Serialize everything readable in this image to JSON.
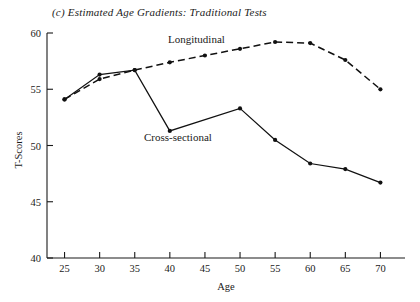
{
  "chart_data": {
    "type": "line",
    "title": "(c) Estimated Age Gradients: Traditional Tests",
    "xlabel": "Age",
    "ylabel": "T-Scores",
    "x": [
      25,
      30,
      35,
      40,
      45,
      50,
      55,
      60,
      65,
      70
    ],
    "xlim": [
      22.5,
      73.5
    ],
    "ylim": [
      40,
      60
    ],
    "xticks": [
      25,
      30,
      35,
      40,
      45,
      50,
      55,
      60,
      65,
      70
    ],
    "yticks": [
      40,
      45,
      50,
      55,
      60
    ],
    "xtick_labels": [
      "25",
      "30",
      "35",
      "40",
      "45",
      "50",
      "55",
      "60",
      "65",
      "70"
    ],
    "ytick_labels": [
      "40",
      "45",
      "50",
      "55",
      "60"
    ],
    "grid": false,
    "legend_position": "inline-annotations",
    "series": [
      {
        "name": "Longitudinal",
        "style": "dashed",
        "x": [
          25,
          30,
          35,
          40,
          45,
          50,
          55,
          60,
          65,
          70
        ],
        "values": [
          54.1,
          55.9,
          56.7,
          57.4,
          58.0,
          58.6,
          59.2,
          59.1,
          57.6,
          55.0
        ]
      },
      {
        "name": "Cross-sectional",
        "style": "solid",
        "x": [
          25,
          30,
          35,
          40,
          45,
          50,
          55,
          60,
          65,
          70
        ],
        "values": [
          54.1,
          56.3,
          56.7,
          51.3,
          null,
          53.3,
          50.5,
          48.4,
          47.9,
          46.7
        ]
      }
    ],
    "annotations": [
      {
        "text": "Longitudinal",
        "x_px": 168,
        "y_px": 43
      },
      {
        "text": "Cross-sectional",
        "x_px": 144,
        "y_px": 141
      }
    ]
  }
}
